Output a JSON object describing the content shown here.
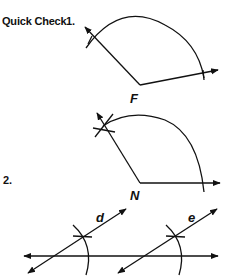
{
  "header": {
    "title": "Quick Check"
  },
  "problems": [
    {
      "number": "1.",
      "figures": [
        {
          "vertex_label": "F"
        },
        {
          "vertex_label": "N"
        }
      ]
    },
    {
      "number": "2.",
      "line_labels": [
        "d",
        "e"
      ]
    }
  ]
}
